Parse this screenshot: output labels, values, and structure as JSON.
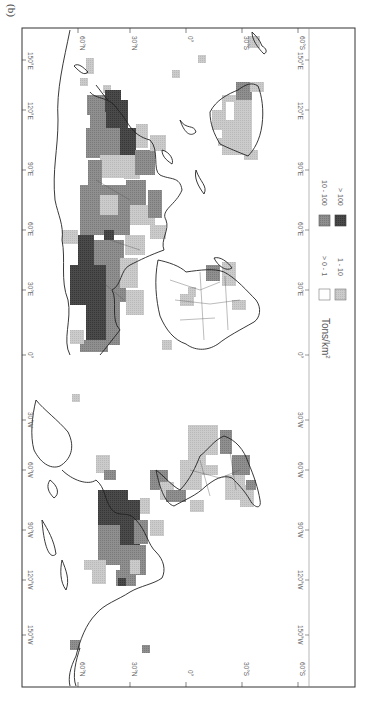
{
  "figure": {
    "panel_label": "(b)",
    "orientation": "rotated 90 degrees clockwise (north to the left)"
  },
  "axes": {
    "latitude_ticks": [
      "60°N",
      "30°N",
      "0°",
      "30°S",
      "60°S"
    ],
    "longitude_ticks": [
      "150°E",
      "120°E",
      "90°E",
      "60°E",
      "30°E",
      "0°",
      "30°W",
      "60°W",
      "90°W",
      "120°W",
      "150°W"
    ]
  },
  "legend": {
    "title": "Tons/km",
    "title_superscript": "2",
    "items": [
      {
        "label": "> 0 - 1",
        "color": "#ffffff"
      },
      {
        "label": "1 - 10",
        "color": "#c9c9c9"
      },
      {
        "label": "10 - 100",
        "color": "#8c8c8c"
      },
      {
        "label": "> 100",
        "color": "#454545"
      }
    ]
  },
  "colors": {
    "frame": "#333333",
    "coast": "#222222",
    "class_1_10": "#c9c9c9",
    "class_10_100": "#8c8c8c",
    "class_gt100": "#454545"
  }
}
